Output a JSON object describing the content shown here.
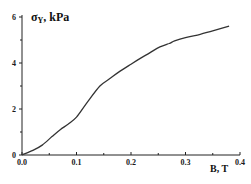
{
  "chart_data": {
    "type": "line",
    "title": "",
    "xlabel": "B, T",
    "ylabel": "σY, kPa",
    "ylabel_main": "σ",
    "ylabel_sub": "Y",
    "ylabel_unit": ", kPa",
    "xlim": [
      0.0,
      0.4
    ],
    "ylim": [
      0,
      6
    ],
    "x_ticks": [
      0.0,
      0.1,
      0.2,
      0.3,
      0.4
    ],
    "x_tick_labels": [
      "0.0",
      "0.1",
      "0.2",
      "0.3",
      "0.4"
    ],
    "x_minor_ticks": [
      0.05,
      0.15,
      0.25,
      0.35
    ],
    "y_ticks": [
      0,
      2,
      4,
      6
    ],
    "y_tick_labels": [
      "0",
      "2",
      "4",
      "6"
    ],
    "y_minor_ticks": [
      1,
      3,
      5
    ],
    "grid": false,
    "legend": null,
    "series": [
      {
        "name": "σY(B)",
        "color": "#333333",
        "x": [
          0.0,
          0.02,
          0.037,
          0.055,
          0.07,
          0.085,
          0.1,
          0.12,
          0.143,
          0.16,
          0.18,
          0.2,
          0.217,
          0.235,
          0.253,
          0.27,
          0.28,
          0.3,
          0.327,
          0.35,
          0.38
        ],
        "y": [
          0.0,
          0.2,
          0.43,
          0.8,
          1.1,
          1.35,
          1.65,
          2.3,
          3.0,
          3.3,
          3.65,
          3.95,
          4.2,
          4.45,
          4.7,
          4.85,
          4.96,
          5.1,
          5.25,
          5.4,
          5.6
        ]
      }
    ]
  }
}
